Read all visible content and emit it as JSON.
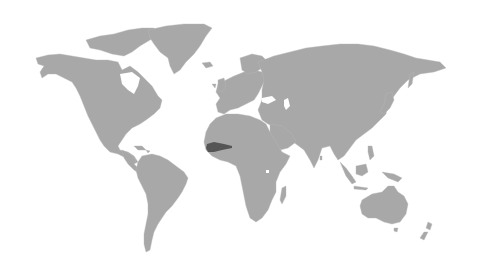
{
  "map": {
    "type": "world-choropleth",
    "background_color": "#ffffff",
    "land_color": "#a8a8a8",
    "highlight_color": "#555555",
    "highlighted_regions": [
      {
        "name": "highlighted-country-west-africa",
        "continent": "Africa"
      }
    ],
    "continents": [
      "North America",
      "Greenland",
      "South America",
      "Europe",
      "Africa",
      "Asia",
      "Australia",
      "New Zealand"
    ]
  }
}
